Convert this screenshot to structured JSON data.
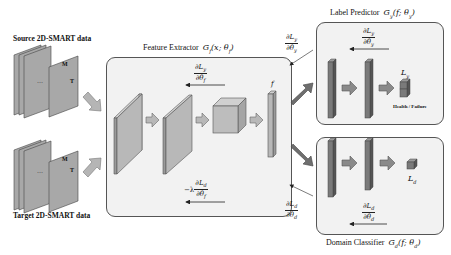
{
  "inputs": {
    "source_label": "Source 2D-SMART data",
    "target_label": "Target 2D-SMART data",
    "sheet_labels": {
      "m": "M",
      "t": "T",
      "dots": "···"
    }
  },
  "feature_extractor": {
    "title": "Feature Extractor",
    "func": "G",
    "func_sub": "f",
    "func_args": "(x; θ",
    "func_args_sub": "f",
    "func_close": ")",
    "grad_top": {
      "num": "∂L",
      "num_sub": "y",
      "den": "∂θ",
      "den_sub": "f"
    },
    "grad_bottom": {
      "prefix": "−λ",
      "num": "∂L",
      "num_sub": "d",
      "den": "∂θ",
      "den_sub": "f"
    },
    "output_label": "f"
  },
  "label_predictor": {
    "title": "Label Predictor",
    "func": "G",
    "func_sub": "y",
    "func_args": "(f; θ",
    "func_args_sub": "y",
    "func_close": ")",
    "grad": {
      "num": "∂L",
      "num_sub": "y",
      "den": "∂θ",
      "den_sub": "y"
    },
    "loss": "L",
    "loss_sub": "y",
    "output_caption": "Health / Failure"
  },
  "domain_classifier": {
    "title": "Domain Classifier",
    "func": "G",
    "func_sub": "d",
    "func_args": "(f; θ",
    "func_args_sub": "d",
    "func_close": ")",
    "grad": {
      "num": "∂L",
      "num_sub": "d",
      "den": "∂θ",
      "den_sub": "d"
    },
    "loss": "L",
    "loss_sub": "d"
  },
  "connector_grads": {
    "upper": {
      "num": "∂L",
      "num_sub": "y",
      "den": "∂θ",
      "den_sub": "y"
    },
    "lower": {
      "num": "∂L",
      "num_sub": "d",
      "den": "∂θ",
      "den_sub": "d"
    }
  },
  "colors": {
    "panel_bg": "#f2f2f2",
    "panel_border": "#555555",
    "sheet_fill": "#a8a8a8",
    "block_fill": "#b8b8b8",
    "block_dark": "#6f6f6f",
    "arrow_fill": "#9a9a9a",
    "dark_arrow": "#6e6e6e"
  }
}
